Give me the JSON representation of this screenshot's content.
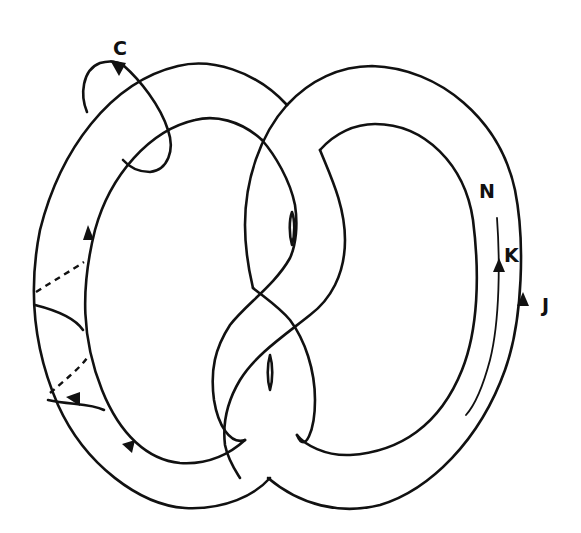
{
  "figure": {
    "labels": {
      "c": "C",
      "n": "N",
      "k": "K",
      "j": "J"
    },
    "colors": {
      "ink": "#111111",
      "background": "#ffffff"
    }
  }
}
